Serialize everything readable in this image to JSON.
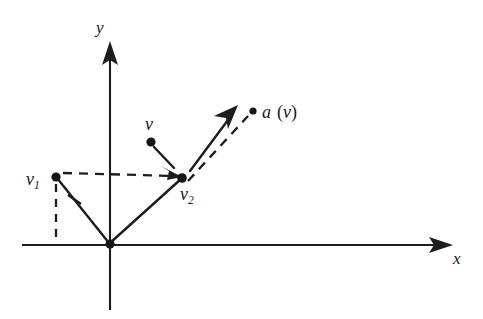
{
  "figure": {
    "background_color": "#ffffff",
    "ink_color": "#1d1d1d",
    "width": 483,
    "height": 319
  },
  "axes": {
    "x_label": "x",
    "y_label": "y",
    "origin_label": "",
    "x_axis": {
      "x1": 22,
      "y1": 245,
      "x2": 452,
      "y2": 245
    },
    "y_axis": {
      "x1": 110,
      "y1": 310,
      "x2": 110,
      "y2": 42
    },
    "x_label_pos": {
      "x": 455,
      "y": 263
    },
    "y_label_pos": {
      "x": 96,
      "y": 33
    }
  },
  "points": [
    {
      "name": "origin",
      "label": "",
      "x": 110,
      "y": 244,
      "r": 4.6
    },
    {
      "name": "v1",
      "label": "v",
      "subscript": "1",
      "x": 56,
      "y": 177,
      "r": 4.6,
      "label_x": 27,
      "label_y": 184
    },
    {
      "name": "v",
      "label": "v",
      "subscript": "",
      "x": 151,
      "y": 142,
      "r": 4.6,
      "label_x": 144,
      "label_y": 129
    },
    {
      "name": "v2",
      "label": "v",
      "subscript": "2",
      "x": 182,
      "y": 178,
      "r": 4.8,
      "label_x": 181,
      "label_y": 199
    },
    {
      "name": "av",
      "label": "a (v)",
      "x": 253,
      "y": 111,
      "r": 3.6,
      "label_x": 262,
      "label_y": 117
    }
  ],
  "labels": {
    "v1": {
      "base": "v",
      "sub": "1"
    },
    "v": {
      "base": "v",
      "sub": ""
    },
    "v2": {
      "base": "v",
      "sub": "2"
    },
    "av_func": "a",
    "av_open": "(",
    "av_arg": "v",
    "av_close": ")",
    "x_axis": "x",
    "y_axis": "y"
  },
  "segments": [
    {
      "name": "v1-to-origin-solid",
      "style": "solid",
      "arrow": false,
      "x1": 56,
      "y1": 177,
      "x2": 110,
      "y2": 244
    },
    {
      "name": "origin-to-v2-solid",
      "style": "solid",
      "arrow": false,
      "x1": 110,
      "y1": 244,
      "x2": 182,
      "y2": 178
    },
    {
      "name": "v1-vertical-dashed-drop",
      "style": "dashed",
      "arrow": false,
      "x1": 56,
      "y1": 183,
      "x2": 56,
      "y2": 245
    },
    {
      "name": "v1-to-v2-dashed",
      "style": "dashed",
      "arrow": false,
      "x1": 62,
      "y1": 172,
      "x2": 177,
      "y2": 180
    },
    {
      "name": "v-to-v2-arrow",
      "style": "solid",
      "arrow": true,
      "x1": 153,
      "y1": 147,
      "x2": 179,
      "y2": 174
    },
    {
      "name": "v2-to-av-arrow",
      "style": "solid",
      "arrow": true,
      "x1": 189,
      "y1": 170,
      "x2": 237,
      "y2": 107
    },
    {
      "name": "v2-to-av-dashed",
      "style": "dashed",
      "arrow": false,
      "x1": 187,
      "y1": 180,
      "x2": 248,
      "y2": 114
    }
  ],
  "tick_marks": [
    {
      "name": "angle-tick-on-v1-origin",
      "x1": 69,
      "y1": 196,
      "x2": 82,
      "y2": 203
    }
  ],
  "arrow_heads": [
    {
      "name": "x-axis-arrowhead",
      "tip_x": 452,
      "tip_y": 245,
      "angle": 0
    },
    {
      "name": "y-axis-arrowhead",
      "tip_x": 110,
      "tip_y": 42,
      "angle": -90
    },
    {
      "name": "v-to-v2-arrowhead",
      "tip_x": 181,
      "tip_y": 176,
      "angle": 46
    },
    {
      "name": "v2-to-av-arrowhead",
      "tip_x": 238,
      "tip_y": 106,
      "angle": -53
    }
  ]
}
